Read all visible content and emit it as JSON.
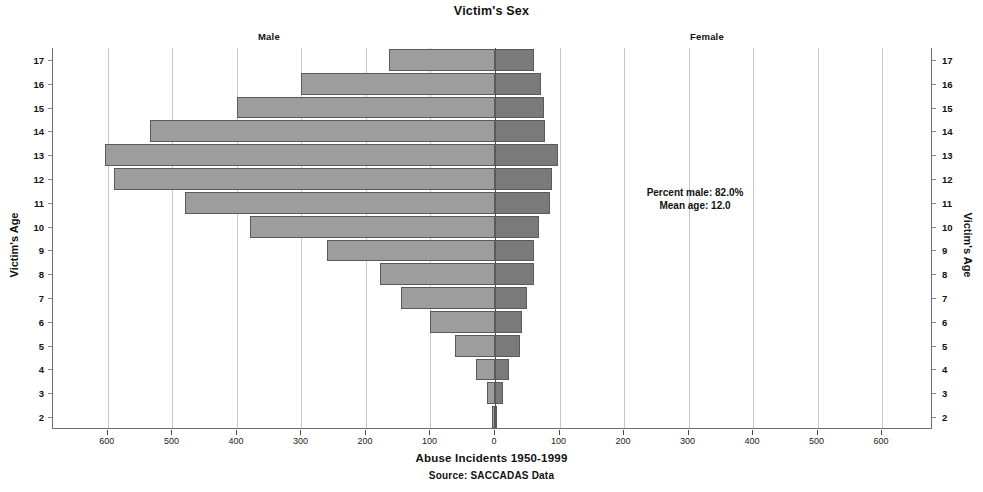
{
  "title": "Victim's Sex",
  "groups": {
    "left_label": "Male",
    "right_label": "Female"
  },
  "annotation": {
    "percent_male": "Percent male: 82.0%",
    "mean_age": "Mean age: 12.0"
  },
  "axis": {
    "y_title_left": "Victim's Age",
    "y_title_right": "Victim's Age",
    "x_title": "Abuse Incidents 1950-1999",
    "source": "Source: SACCADAS Data"
  },
  "colors": {
    "male_bar": "#9d9d9d",
    "female_bar": "#7a7a7a",
    "bar_border": "#5a5a5a",
    "gridline": "#c9c9c9",
    "zero_line": "#4a4a4a",
    "frame": "#6d6d6d",
    "text": "#111111",
    "background": "#ffffff"
  },
  "chart_data": {
    "type": "bar",
    "subtype": "population-pyramid",
    "title": "Victim's Sex",
    "subtitle": "",
    "xlabel": "Abuse Incidents 1950-1999",
    "ylabel": "Victim's Age",
    "source": "Source: SACCADAS Data",
    "orientation": "horizontal",
    "grid": true,
    "legend_position": "above-panels",
    "categories": [
      17,
      16,
      15,
      14,
      13,
      12,
      11,
      10,
      9,
      8,
      7,
      6,
      5,
      4,
      3,
      2
    ],
    "category_labels": [
      "17",
      "16",
      "15",
      "14",
      "13",
      "12",
      "11",
      "10",
      "9",
      "8",
      "7",
      "6",
      "5",
      "4",
      "3",
      "2"
    ],
    "x_tick_labels_left": [
      "600",
      "500",
      "400",
      "300",
      "200",
      "100",
      "0"
    ],
    "x_tick_labels_right": [
      "0",
      "100",
      "200",
      "300",
      "400",
      "500",
      "600"
    ],
    "x_tick_values_left": [
      600,
      500,
      400,
      300,
      200,
      100,
      0
    ],
    "x_tick_values_right": [
      0,
      100,
      200,
      300,
      400,
      500,
      600
    ],
    "xlim": [
      -685,
      685
    ],
    "axis_note": "Left half = Male counts (plotted leftward from 0); right half = Female counts.",
    "series": [
      {
        "name": "Male",
        "side": "left",
        "color": "#9d9d9d",
        "values": [
          165,
          300,
          400,
          535,
          605,
          590,
          480,
          380,
          260,
          178,
          145,
          100,
          62,
          30,
          12,
          4
        ]
      },
      {
        "name": "Female",
        "side": "right",
        "color": "#7a7a7a",
        "values": [
          60,
          72,
          76,
          78,
          97,
          88,
          85,
          68,
          60,
          60,
          50,
          42,
          38,
          22,
          12,
          3
        ]
      }
    ],
    "annotations": [
      {
        "text": "Percent male: 82.0%",
        "x": 295,
        "y": 12
      },
      {
        "text": "Mean age: 12.0",
        "x": 295,
        "y": 11.4
      }
    ]
  }
}
